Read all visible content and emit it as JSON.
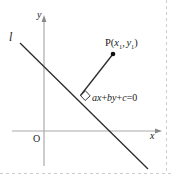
{
  "figure": {
    "title_text": "",
    "background_color": "#ffffff",
    "border": {
      "style": "dashed",
      "color": "#cccccc",
      "edges": [
        "bottom",
        "right"
      ]
    },
    "labels": {
      "line_label": "l",
      "y_axis_label": "y",
      "x_axis_label": "x",
      "origin_label": "O",
      "point_label_main": "P(",
      "point_label_x": "x",
      "point_label_x_sub": "1",
      "point_label_sep": ",",
      "point_label_y": "y",
      "point_label_y_sub": "1",
      "point_label_close": ")",
      "equation_a": "ax",
      "equation_plus1": "+",
      "equation_b": "by",
      "equation_plus2": "+",
      "equation_c": "c",
      "equation_eq": "=0"
    },
    "colors": {
      "axis": "#aaaaaa",
      "line": "#2b2b2b",
      "segment": "#2b2b2b",
      "text": "#1a1a1a",
      "point": "#111111",
      "border": "#cccccc"
    },
    "geometry": {
      "y_axis": {
        "x": 44,
        "y_top": 18,
        "y_bottom": 166
      },
      "x_axis": {
        "y": 131,
        "x_left": 12,
        "x_right": 160
      },
      "line_l": {
        "x1": 20,
        "y1": 43,
        "x2": 148,
        "y2": 169
      },
      "perpendicular": {
        "x1": 113,
        "y1": 54,
        "x2": 80,
        "y2": 96
      },
      "point_p": {
        "x": 113,
        "y": 54,
        "r": 2.2
      },
      "right_angle_marker": {
        "x": 80,
        "y": 96,
        "size": 6
      }
    }
  }
}
